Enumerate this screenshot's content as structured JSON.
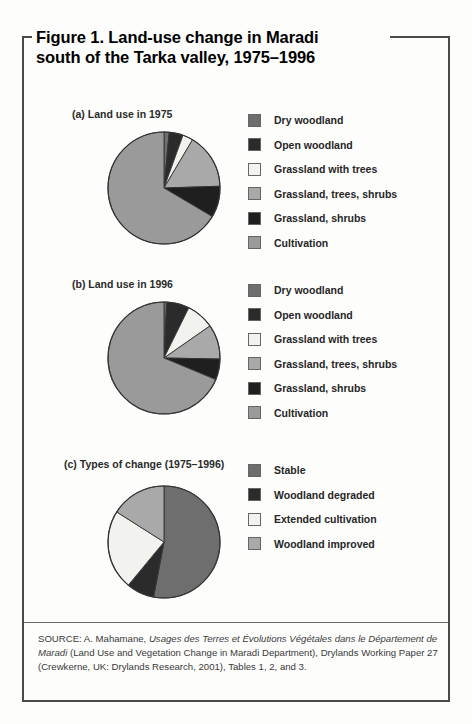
{
  "figure": {
    "title_line1": "Figure 1. Land-use change in Maradi",
    "title_line2": "south of the Tarka valley, 1975–1996",
    "source_prefix": "SOURCE: A. Mahamane, ",
    "source_italic1": "Usages des Terres et Évolutions Végétales dans le Département de Maradi",
    "source_rest": " (Land Use and Vegetation Change in Maradi Department), Drylands Working Paper 27 (Crewkerne, UK: Drylands Research, 2001), Tables 1, 2, and 3."
  },
  "palette": {
    "dry_woodland": "#6e6e6e",
    "open_woodland": "#2b2b2b",
    "grassland_with_trees": "#f2f2ee",
    "grassland_trees_shrubs": "#a9a9a9",
    "grassland_shrubs": "#1f1f1f",
    "cultivation": "#9a9a9a",
    "stable": "#6e6e6e",
    "woodland_degraded": "#2b2b2b",
    "extended_cultivation": "#f2f2ee",
    "woodland_improved": "#a9a9a9",
    "outline": "#333333",
    "frame": "#4a4a4a"
  },
  "chart_data": [
    {
      "id": "a",
      "type": "pie",
      "title": "(a) Land use in 1975",
      "start_angle": 0,
      "categories": [
        "Dry woodland",
        "Open woodland",
        "Grassland with trees",
        "Grassland, trees, shrubs",
        "Grassland, shrubs",
        "Cultivation"
      ],
      "values": [
        1.5,
        4.0,
        3.0,
        16.0,
        9.0,
        66.5
      ],
      "colors": [
        "#6e6e6e",
        "#2b2b2b",
        "#f2f2ee",
        "#a9a9a9",
        "#1f1f1f",
        "#9a9a9a"
      ],
      "legend": [
        {
          "label": "Dry woodland",
          "color": "#6e6e6e"
        },
        {
          "label": "Open woodland",
          "color": "#2b2b2b"
        },
        {
          "label": "Grassland with trees",
          "color": "#f2f2ee"
        },
        {
          "label": "Grassland, trees, shrubs",
          "color": "#a9a9a9"
        },
        {
          "label": "Grassland, shrubs",
          "color": "#1f1f1f"
        },
        {
          "label": "Cultivation",
          "color": "#9a9a9a"
        }
      ]
    },
    {
      "id": "b",
      "type": "pie",
      "title": "(b) Land use in 1996",
      "start_angle": 0,
      "categories": [
        "Dry woodland",
        "Open woodland",
        "Grassland with trees",
        "Grassland, trees, shrubs",
        "Grassland, shrubs",
        "Cultivation"
      ],
      "values": [
        0.8,
        6.5,
        8.0,
        10.0,
        6.0,
        68.7
      ],
      "colors": [
        "#6e6e6e",
        "#2b2b2b",
        "#f2f2ee",
        "#a9a9a9",
        "#1f1f1f",
        "#9a9a9a"
      ],
      "legend": [
        {
          "label": "Dry woodland",
          "color": "#6e6e6e"
        },
        {
          "label": "Open woodland",
          "color": "#2b2b2b"
        },
        {
          "label": "Grassland with trees",
          "color": "#f2f2ee"
        },
        {
          "label": "Grassland, trees, shrubs",
          "color": "#a9a9a9"
        },
        {
          "label": "Grassland, shrubs",
          "color": "#1f1f1f"
        },
        {
          "label": "Cultivation",
          "color": "#9a9a9a"
        }
      ]
    },
    {
      "id": "c",
      "type": "pie",
      "title": "(c) Types of change (1975–1996)",
      "start_angle": 0,
      "categories": [
        "Stable",
        "Woodland degraded",
        "Extended cultivation",
        "Woodland improved"
      ],
      "values": [
        53.0,
        8.0,
        23.0,
        16.0
      ],
      "colors": [
        "#6e6e6e",
        "#2b2b2b",
        "#f2f2ee",
        "#a9a9a9"
      ],
      "legend": [
        {
          "label": "Stable",
          "color": "#6e6e6e"
        },
        {
          "label": "Woodland degraded",
          "color": "#2b2b2b"
        },
        {
          "label": "Extended cultivation",
          "color": "#f2f2ee"
        },
        {
          "label": "Woodland improved",
          "color": "#a9a9a9"
        }
      ]
    }
  ]
}
